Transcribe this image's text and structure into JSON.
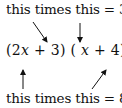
{
  "top_annotation": {
    "prefix": "this times this = ",
    "coef": "3",
    "var": "x"
  },
  "expression": {
    "open1": "(",
    "factor1_coef": "2",
    "factor1_var": "x",
    "factor1_op": " + ",
    "factor1_const": "3",
    "close1": ")",
    "gap": " ",
    "open2": "(",
    "factor2_var": "x",
    "factor2_op": " + ",
    "factor2_const": "4",
    "close2": ")"
  },
  "bottom_annotation": {
    "prefix": "this times this = ",
    "coef": "8",
    "var": "x"
  },
  "colors": {
    "ink": "#111111",
    "background": "#ffffff"
  }
}
